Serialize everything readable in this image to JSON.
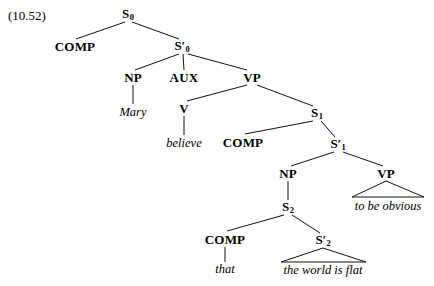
{
  "figure": {
    "number_label": "(10.52)",
    "ink_color": "#111111",
    "background_color": "#ffffff"
  },
  "tree": {
    "nodes": [
      {
        "id": "S0",
        "label": "S",
        "sub": "0",
        "prime": "",
        "x": 128,
        "y": 14
      },
      {
        "id": "COMP0",
        "label": "COMP",
        "sub": "",
        "prime": "",
        "x": 75,
        "y": 46
      },
      {
        "id": "Sbar0",
        "label": "S",
        "sub": "0",
        "prime": "′",
        "x": 182,
        "y": 46
      },
      {
        "id": "NP0",
        "label": "NP",
        "sub": "",
        "prime": "",
        "x": 133,
        "y": 77
      },
      {
        "id": "AUX",
        "label": "AUX",
        "sub": "",
        "prime": "",
        "x": 184,
        "y": 77
      },
      {
        "id": "VP0",
        "label": "VP",
        "sub": "",
        "prime": "",
        "x": 252,
        "y": 77
      },
      {
        "id": "V",
        "label": "V",
        "sub": "",
        "prime": "",
        "x": 184,
        "y": 108
      },
      {
        "id": "S1",
        "label": "S",
        "sub": "1",
        "prime": "",
        "x": 317,
        "y": 113
      },
      {
        "id": "COMP1",
        "label": "COMP",
        "sub": "",
        "prime": "",
        "x": 243,
        "y": 142
      },
      {
        "id": "Sbar1",
        "label": "S",
        "sub": "1",
        "prime": "′",
        "x": 338,
        "y": 144
      },
      {
        "id": "NP1",
        "label": "NP",
        "sub": "",
        "prime": "",
        "x": 288,
        "y": 173
      },
      {
        "id": "VP1",
        "label": "VP",
        "sub": "",
        "prime": "",
        "x": 386,
        "y": 173
      },
      {
        "id": "S2",
        "label": "S",
        "sub": "2",
        "prime": "",
        "x": 288,
        "y": 207
      },
      {
        "id": "COMP2",
        "label": "COMP",
        "sub": "",
        "prime": "",
        "x": 225,
        "y": 239
      },
      {
        "id": "Sbar2",
        "label": "S",
        "sub": "2",
        "prime": "′",
        "x": 323,
        "y": 240
      }
    ],
    "leaves": [
      {
        "id": "leaf-mary",
        "text": "Mary",
        "x": 133,
        "y": 112
      },
      {
        "id": "leaf-believe",
        "text": "believe",
        "x": 184,
        "y": 143
      },
      {
        "id": "leaf-obvious",
        "text": "to be obvious",
        "x": 388,
        "y": 206
      },
      {
        "id": "leaf-that",
        "text": "that",
        "x": 225,
        "y": 269
      },
      {
        "id": "leaf-flat",
        "text": "the world is flat",
        "x": 323,
        "y": 270
      }
    ],
    "edges": [
      {
        "from": "S0",
        "to": "COMP0",
        "x1": 125,
        "y1": 22,
        "x2": 76,
        "y2": 39
      },
      {
        "from": "S0",
        "to": "Sbar0",
        "x1": 132,
        "y1": 22,
        "x2": 179,
        "y2": 39
      },
      {
        "from": "Sbar0",
        "to": "NP0",
        "x1": 179,
        "y1": 54,
        "x2": 135,
        "y2": 70
      },
      {
        "from": "Sbar0",
        "to": "AUX",
        "x1": 183,
        "y1": 54,
        "x2": 184,
        "y2": 70
      },
      {
        "from": "Sbar0",
        "to": "VP0",
        "x1": 188,
        "y1": 54,
        "x2": 247,
        "y2": 70
      },
      {
        "from": "NP0",
        "to": "leaf-mary",
        "x1": 133,
        "y1": 85,
        "x2": 133,
        "y2": 104
      },
      {
        "from": "VP0",
        "to": "V",
        "x1": 247,
        "y1": 85,
        "x2": 187,
        "y2": 101
      },
      {
        "from": "VP0",
        "to": "S1",
        "x1": 257,
        "y1": 85,
        "x2": 313,
        "y2": 106
      },
      {
        "from": "V",
        "to": "leaf-believe",
        "x1": 184,
        "y1": 116,
        "x2": 184,
        "y2": 135
      },
      {
        "from": "S1",
        "to": "COMP1",
        "x1": 313,
        "y1": 121,
        "x2": 245,
        "y2": 134
      },
      {
        "from": "S1",
        "to": "Sbar1",
        "x1": 321,
        "y1": 121,
        "x2": 335,
        "y2": 137
      },
      {
        "from": "Sbar1",
        "to": "NP1",
        "x1": 334,
        "y1": 152,
        "x2": 291,
        "y2": 166
      },
      {
        "from": "Sbar1",
        "to": "VP1",
        "x1": 343,
        "y1": 152,
        "x2": 383,
        "y2": 166
      },
      {
        "from": "NP1",
        "to": "S2",
        "x1": 288,
        "y1": 181,
        "x2": 288,
        "y2": 200
      },
      {
        "from": "S2",
        "to": "COMP2",
        "x1": 284,
        "y1": 215,
        "x2": 227,
        "y2": 231
      },
      {
        "from": "S2",
        "to": "Sbar2",
        "x1": 292,
        "y1": 215,
        "x2": 320,
        "y2": 233
      },
      {
        "from": "COMP2",
        "to": "leaf-that",
        "x1": 225,
        "y1": 247,
        "x2": 225,
        "y2": 262
      }
    ],
    "triangles": [
      {
        "id": "triangle-vp1",
        "apex_x": 386,
        "apex_y": 181,
        "left_x": 352,
        "right_x": 424,
        "base_y": 197
      },
      {
        "id": "triangle-sbar2",
        "apex_x": 323,
        "apex_y": 248,
        "left_x": 281,
        "right_x": 366,
        "base_y": 262
      }
    ]
  }
}
